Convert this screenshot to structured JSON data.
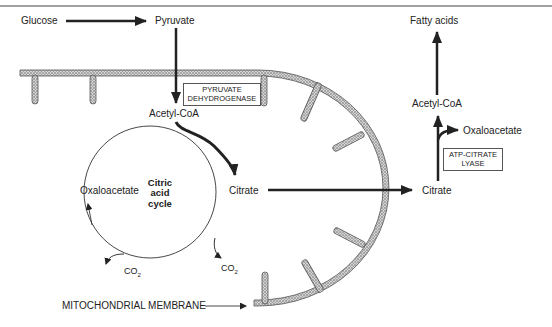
{
  "diagram": {
    "title_rule": true,
    "metabolites": {
      "glucose": "Glucose",
      "pyruvate": "Pyruvate",
      "acetyl_coa_mito": "Acetyl-CoA",
      "oxaloacetate_mito": "Oxaloacetate",
      "citrate_mito": "Citrate",
      "citrate_cyto": "Citrate",
      "acetyl_coa_cyto": "Acetyl-CoA",
      "oxaloacetate_cyto": "Oxaloacetate",
      "fatty_acids": "Fatty acids",
      "co2_left": "CO",
      "co2_right": "CO",
      "co2_sub": "2"
    },
    "enzymes": {
      "pdh_line1": "PYRUVATE",
      "pdh_line2": "DEHYDROGENASE",
      "acl_line1": "ATP-CITRATE",
      "acl_line2": "LYASE"
    },
    "cycle": {
      "line1": "Citric",
      "line2": "acid",
      "line3": "cycle"
    },
    "membrane_label": "MITOCHONDRIAL MEMBRANE",
    "colors": {
      "ink": "#222222",
      "membrane_fill": "#b9b9b9",
      "membrane_edge": "#555555"
    }
  }
}
